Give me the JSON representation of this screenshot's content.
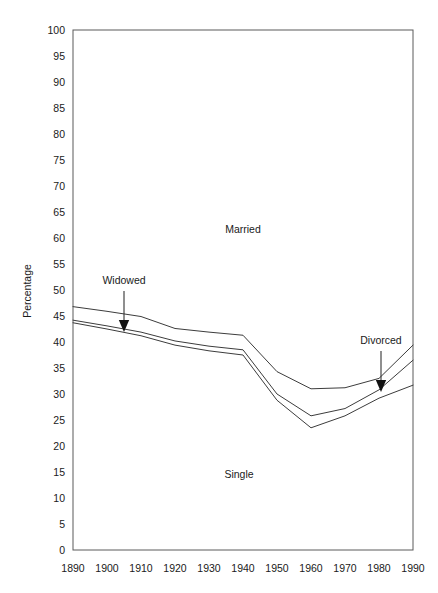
{
  "chart_data": {
    "type": "line",
    "title": "",
    "subtitle": "",
    "xlabel": "",
    "ylabel": "Percentage",
    "xlim": [
      1890,
      1990
    ],
    "ylim": [
      0,
      100
    ],
    "grid": false,
    "legend_position": "inline-annotations",
    "x": [
      1890,
      1900,
      1910,
      1920,
      1930,
      1940,
      1950,
      1960,
      1970,
      1980,
      1990
    ],
    "xticklabels": [
      "1890",
      "1900",
      "1910",
      "1920",
      "1930",
      "1940",
      "1950",
      "1960",
      "1970",
      "1980",
      "1990"
    ],
    "yticks": [
      0,
      5,
      10,
      15,
      20,
      25,
      30,
      35,
      40,
      45,
      50,
      55,
      60,
      65,
      70,
      75,
      80,
      85,
      90,
      95,
      100
    ],
    "yticklabels": [
      "0",
      "5",
      "10",
      "15",
      "20",
      "25",
      "30",
      "35",
      "40",
      "45",
      "50",
      "55",
      "60",
      "65",
      "70",
      "75",
      "80",
      "85",
      "90",
      "95",
      "100"
    ],
    "note": "Cumulative boundary lines dividing the area into Single (bottom), Divorced, Widowed and Married (top) bands.",
    "series": [
      {
        "name": "boundary-upper-widowed",
        "description": "Upper boundary line: top of Widowed band / base of Married band",
        "values": [
          46.8,
          45.9,
          44.9,
          42.6,
          41.9,
          41.3,
          34.3,
          31.0,
          31.2,
          33.0,
          39.4
        ]
      },
      {
        "name": "boundary-middle-divorced",
        "description": "Middle boundary line: top of Divorced band",
        "values": [
          44.2,
          43.1,
          41.9,
          40.2,
          39.2,
          38.5,
          30.0,
          25.8,
          27.2,
          30.8,
          36.5
        ]
      },
      {
        "name": "boundary-lower-single",
        "description": "Lower boundary line: top of Single band",
        "values": [
          43.7,
          42.5,
          41.2,
          39.4,
          38.3,
          37.5,
          28.8,
          23.5,
          25.8,
          29.2,
          31.7
        ]
      }
    ],
    "annotations": [
      {
        "id": "married",
        "text": "Married",
        "kind": "band-label",
        "x_px": 243,
        "y_px": 233
      },
      {
        "id": "single",
        "text": "Single",
        "kind": "band-label",
        "x_px": 239,
        "y_px": 478
      },
      {
        "id": "widowed",
        "text": "Widowed",
        "kind": "arrow-label",
        "x_px": 124,
        "y_px": 284,
        "arrow_from_y_px": 291,
        "arrow_to_y_px": 332
      },
      {
        "id": "divorced",
        "text": "Divorced",
        "kind": "arrow-label",
        "x_px": 381,
        "y_px": 344,
        "arrow_from_y_px": 351,
        "arrow_to_y_px": 392
      }
    ],
    "colors": {
      "line": "#3c3c3c",
      "frame": "#5a5a5a",
      "text": "#1a1a1a",
      "background": "#ffffff"
    }
  },
  "geometry": {
    "plot_left_px": 73,
    "plot_right_px": 413,
    "plot_top_px": 30,
    "plot_bottom_px": 550
  }
}
